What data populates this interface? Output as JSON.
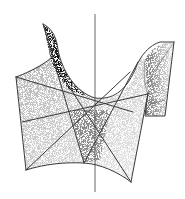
{
  "figure": {
    "colors": {
      "background": "#ffffff",
      "line": "#3a3a3a",
      "stipple": "#000000",
      "axis": "#555555"
    },
    "axis": {
      "x": 95,
      "y1": 14,
      "y2": 192
    },
    "outline": {
      "left_panel": [
        [
          16,
          77
        ],
        [
          26,
          170
        ],
        [
          84,
          163
        ]
      ],
      "right_panel": [
        [
          148,
          93
        ],
        [
          131,
          182
        ]
      ],
      "left_spike": [
        [
          43,
          24
        ],
        [
          50,
          55
        ]
      ],
      "right_spike": [
        [
          145,
          116
        ],
        [
          165,
          116
        ],
        [
          174,
          42
        ]
      ]
    },
    "lines": [
      [
        [
          16,
          77
        ],
        [
          133,
          112
        ]
      ],
      [
        [
          22,
          122
        ],
        [
          148,
          94
        ]
      ],
      [
        [
          26,
          170
        ],
        [
          130,
          72
        ]
      ],
      [
        [
          43,
          24
        ],
        [
          84,
          163
        ]
      ],
      [
        [
          84,
          163
        ],
        [
          138,
          62
        ]
      ],
      [
        [
          55,
          65
        ],
        [
          131,
          182
        ]
      ],
      [
        [
          145,
          85
        ],
        [
          174,
          42
        ]
      ],
      [
        [
          145,
          106
        ],
        [
          165,
          100
        ]
      ]
    ]
  }
}
